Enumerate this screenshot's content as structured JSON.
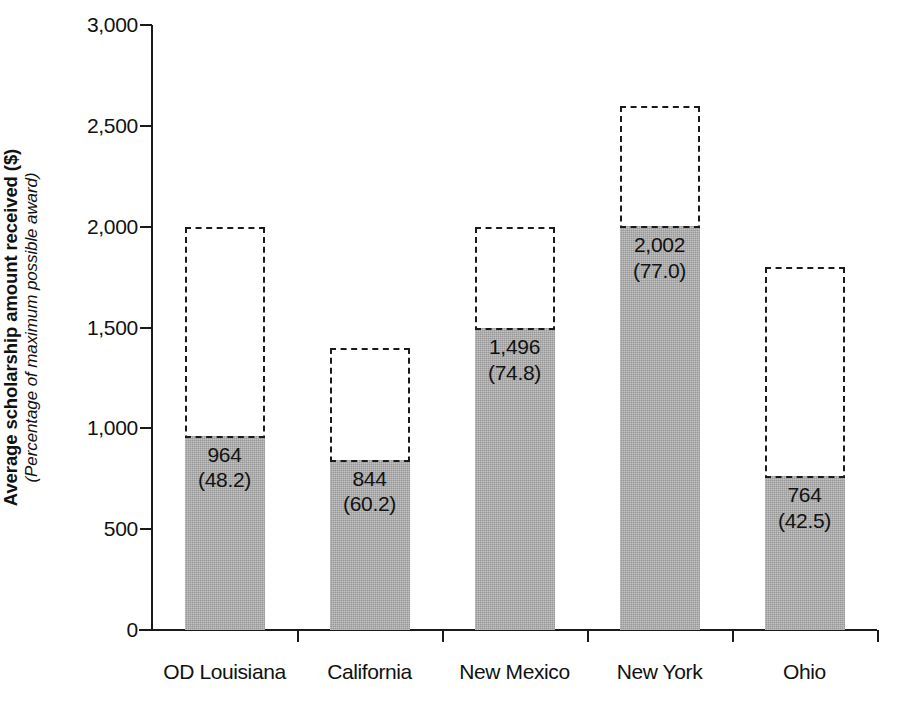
{
  "chart_data": {
    "type": "bar",
    "title": "",
    "subtitle": "",
    "xlabel": "",
    "ylabel": "Average scholarship amount received ($)",
    "ylabel_sub": "(Percentage of maximum possible award)",
    "ylim": [
      0,
      3000
    ],
    "ytick_values": [
      0,
      500,
      1000,
      1500,
      2000,
      2500,
      3000
    ],
    "ytick_labels": [
      "0",
      "500",
      "1,000",
      "1,500",
      "2,000",
      "2,500",
      "3,000"
    ],
    "grid": false,
    "legend": null,
    "categories": [
      "OD Louisiana",
      "California",
      "New Mexico",
      "New York",
      "Ohio"
    ],
    "series": [
      {
        "name": "Average scholarship amount received",
        "values": [
          964,
          844,
          1496,
          2002,
          764
        ],
        "style": "solid-gray-fill"
      },
      {
        "name": "Maximum possible award",
        "values": [
          2000,
          1400,
          2000,
          2600,
          1800
        ],
        "style": "dashed-outline"
      }
    ],
    "percent_labels": [
      "(48.2)",
      "(60.2)",
      "(74.8)",
      "(77.0)",
      "(42.5)"
    ],
    "percent_values": [
      48.2,
      60.2,
      74.8,
      77.0,
      42.5
    ],
    "value_labels": [
      "964",
      "844",
      "1,496",
      "2,002",
      "764"
    ],
    "colors": {
      "bar_fill": "#a9a9a9",
      "outline": "#1a1a1a",
      "axis": "#1a1a1a",
      "text": "#111111",
      "background": "#ffffff"
    }
  },
  "bars": [
    {
      "category": "OD Louisiana",
      "value_label": "964",
      "percent_label": "(48.2)",
      "value": 964,
      "max": 2000
    },
    {
      "category": "California",
      "value_label": "844",
      "percent_label": "(60.2)",
      "value": 844,
      "max": 1400
    },
    {
      "category": "New Mexico",
      "value_label": "1,496",
      "percent_label": "(74.8)",
      "value": 1496,
      "max": 2000
    },
    {
      "category": "New York",
      "value_label": "2,002",
      "percent_label": "(77.0)",
      "value": 2002,
      "max": 2600
    },
    {
      "category": "Ohio",
      "value_label": "764",
      "percent_label": "(42.5)",
      "value": 764,
      "max": 1800
    }
  ],
  "y_axis": {
    "title_main": "Average scholarship amount received ($)",
    "title_sub": "(Percentage of maximum possible award)",
    "ticks": [
      "3,000",
      "2,500",
      "2,000",
      "1,500",
      "1,000",
      "500",
      "0"
    ]
  }
}
